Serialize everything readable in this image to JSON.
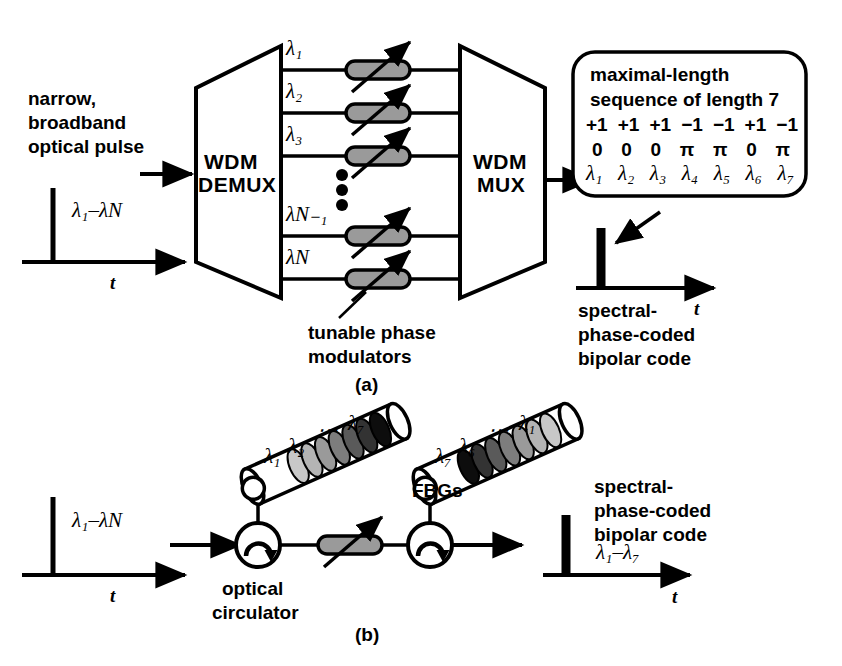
{
  "figure": {
    "panel_a_label": "(a)",
    "panel_b_label": "(b)",
    "background_color": "#ffffff",
    "ink_color": "#000000",
    "grating_gray": "#9a9a9a"
  },
  "panel_a": {
    "input_caption_line1": "narrow,",
    "input_caption_line2": "broadband",
    "input_caption_line3": "optical pulse",
    "input_pulse_label": "λ₁–λN",
    "input_axis_label": "t",
    "demux_line1": "WDM",
    "demux_line2": "DEMUX",
    "mux_line1": "WDM",
    "mux_line2": "MUX",
    "channel_labels": [
      "λ₁",
      "λ₂",
      "λ₃",
      "λN₋₁",
      "λN"
    ],
    "vertical_ellipsis": "⋮",
    "modulator_caption_line1": "tunable phase",
    "modulator_caption_line2": "modulators",
    "callout": {
      "line1": "maximal-length",
      "line2": "sequence of length 7",
      "code_values": [
        "+1",
        "+1",
        "+1",
        "−1",
        "−1",
        "+1",
        "−1"
      ],
      "phase_values": [
        "0",
        "0",
        "0",
        "π",
        "π",
        "0",
        "π"
      ],
      "wavelengths": [
        "λ₁",
        "λ₂",
        "λ₃",
        "λ₄",
        "λ₅",
        "λ₆",
        "λ₇"
      ]
    },
    "output_caption_line1": "spectral-",
    "output_caption_line2": "phase-coded",
    "output_caption_line3": "bipolar code",
    "output_axis_label": "t"
  },
  "panel_b": {
    "input_pulse_label": "λ₁–λN",
    "input_axis_label": "t",
    "fbg1_labels": [
      "λ₁",
      "λ₂",
      "⋯",
      "λ₇"
    ],
    "fbg2_labels": [
      "λ₇",
      "λ₆",
      "⋯",
      "λ₁"
    ],
    "fbgs_label": "FBGs",
    "circulator_line1": "optical",
    "circulator_line2": "circulator",
    "output_caption_line1": "spectral-",
    "output_caption_line2": "phase-coded",
    "output_caption_line3": "bipolar code",
    "output_pulse_label": "λ₁–λ₇",
    "output_axis_label": "t"
  }
}
